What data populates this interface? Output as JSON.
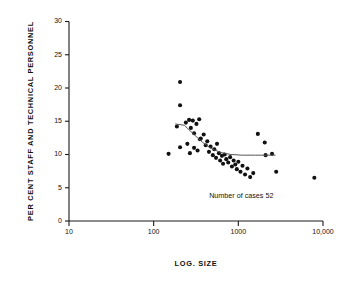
{
  "chart_data": {
    "type": "scatter",
    "title": "",
    "xlabel": "LOG. SIZE",
    "ylabel": "PER CENT STAFF AND TECHNICAL PERSONNEL",
    "xscale": "log",
    "xlim": [
      10,
      10000
    ],
    "ylim": [
      0,
      30
    ],
    "xticks": [
      10,
      100,
      1000,
      10000
    ],
    "xtick_labels": [
      "10",
      "100",
      "1000",
      "10,000"
    ],
    "yticks": [
      0,
      5,
      10,
      15,
      20,
      25,
      30
    ],
    "ytick_labels": [
      "0",
      "5",
      "10",
      "15",
      "20",
      "25",
      "30"
    ],
    "grid": false,
    "legend": false,
    "annotations": [
      {
        "text": "Number of cases 52",
        "x": 2600,
        "y": 3.4
      }
    ],
    "marker_color": "#111111",
    "trend_color": "#555555",
    "series": [
      {
        "name": "establishments",
        "marker": "filled-circle",
        "points": [
          [
            150,
            10.1
          ],
          [
            205,
            20.9
          ],
          [
            205,
            17.4
          ],
          [
            205,
            11.1
          ],
          [
            188,
            14.2
          ],
          [
            240,
            14.8
          ],
          [
            262,
            15.2
          ],
          [
            275,
            14.0
          ],
          [
            290,
            15.1
          ],
          [
            300,
            13.2
          ],
          [
            320,
            14.6
          ],
          [
            345,
            15.3
          ],
          [
            352,
            12.3
          ],
          [
            250,
            11.6
          ],
          [
            268,
            10.2
          ],
          [
            300,
            11.0
          ],
          [
            330,
            10.6
          ],
          [
            360,
            12.4
          ],
          [
            390,
            13.0
          ],
          [
            412,
            11.4
          ],
          [
            430,
            12.0
          ],
          [
            450,
            10.4
          ],
          [
            470,
            11.2
          ],
          [
            500,
            9.9
          ],
          [
            520,
            10.8
          ],
          [
            545,
            9.5
          ],
          [
            560,
            11.6
          ],
          [
            590,
            10.2
          ],
          [
            610,
            9.1
          ],
          [
            640,
            9.8
          ],
          [
            660,
            8.6
          ],
          [
            690,
            10.0
          ],
          [
            720,
            9.3
          ],
          [
            760,
            8.8
          ],
          [
            800,
            9.6
          ],
          [
            840,
            8.2
          ],
          [
            880,
            9.1
          ],
          [
            920,
            8.5
          ],
          [
            960,
            7.8
          ],
          [
            1000,
            8.9
          ],
          [
            1060,
            7.4
          ],
          [
            1120,
            8.3
          ],
          [
            1200,
            7.0
          ],
          [
            1280,
            7.9
          ],
          [
            1380,
            6.6
          ],
          [
            1500,
            7.2
          ],
          [
            1700,
            13.1
          ],
          [
            2050,
            11.8
          ],
          [
            2100,
            9.9
          ],
          [
            2500,
            10.1
          ],
          [
            2800,
            7.4
          ],
          [
            7900,
            6.5
          ]
        ]
      }
    ],
    "trend_line": {
      "name": "fitted-curve",
      "points": [
        [
          180,
          14.6
        ],
        [
          230,
          14.4
        ],
        [
          300,
          13.0
        ],
        [
          380,
          11.8
        ],
        [
          480,
          10.9
        ],
        [
          620,
          10.3
        ],
        [
          820,
          10.0
        ],
        [
          1100,
          9.9
        ],
        [
          1600,
          9.9
        ],
        [
          2300,
          9.9
        ],
        [
          2750,
          9.9
        ]
      ]
    }
  }
}
